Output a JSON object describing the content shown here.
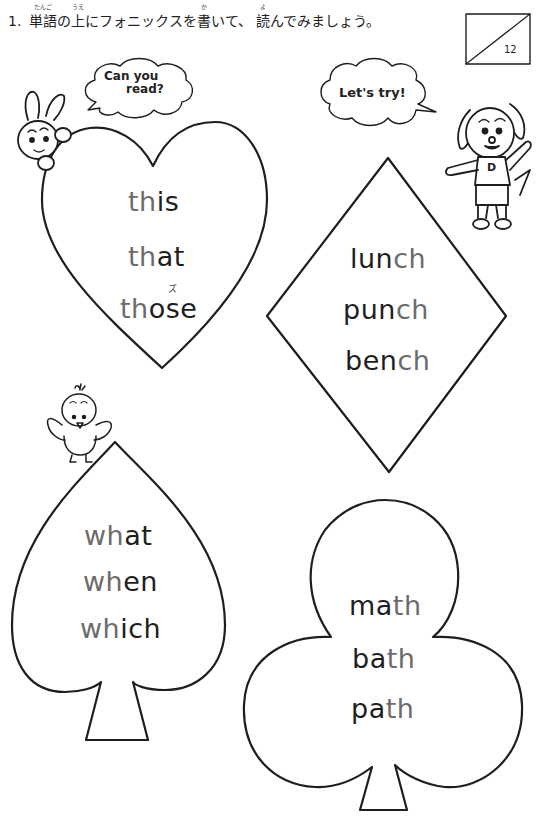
{
  "instruction": {
    "number": "1.",
    "segments": [
      {
        "text": "単語",
        "ruby": "たんご"
      },
      {
        "text": "の",
        "ruby": ""
      },
      {
        "text": "上",
        "ruby": "うえ"
      },
      {
        "text": "にフォニックスを",
        "ruby": ""
      },
      {
        "text": "書",
        "ruby": "か"
      },
      {
        "text": "いて、 ",
        "ruby": ""
      },
      {
        "text": "読",
        "ruby": "よ"
      },
      {
        "text": "んでみましょう。",
        "ruby": ""
      }
    ]
  },
  "score_box": {
    "total": "12"
  },
  "bubbles": {
    "rabbit": {
      "line1": "Can you",
      "line2": "read?"
    },
    "dog": {
      "text": "Let's try!"
    }
  },
  "characters": {
    "rabbit": "rabbit",
    "dog": "dog",
    "dog_shirt_letter": "D",
    "chick": "chick"
  },
  "cards": {
    "heart": {
      "shape": "heart",
      "phonics": "th",
      "words": [
        {
          "hl": "th",
          "rest": "is"
        },
        {
          "hl": "th",
          "rest": "at"
        },
        {
          "hl": "th",
          "rest": "ose"
        }
      ],
      "annotation": "ズ"
    },
    "diamond": {
      "shape": "diamond",
      "phonics": "ch",
      "words": [
        {
          "pre": "lun",
          "hl": "ch"
        },
        {
          "pre": "pun",
          "hl": "ch"
        },
        {
          "pre": "ben",
          "hl": "ch"
        }
      ]
    },
    "spade": {
      "shape": "spade",
      "phonics": "wh",
      "words": [
        {
          "hl": "wh",
          "rest": "at"
        },
        {
          "hl": "wh",
          "rest": "en"
        },
        {
          "hl": "wh",
          "rest": "ich"
        }
      ]
    },
    "club": {
      "shape": "club",
      "phonics": "th",
      "words": [
        {
          "pre": "ma",
          "hl": "th"
        },
        {
          "pre": "ba",
          "hl": "th"
        },
        {
          "pre": "pa",
          "hl": "th"
        }
      ]
    }
  },
  "colors": {
    "ink": "#1e1e1e",
    "highlight": "#6b6b6b",
    "background": "#ffffff"
  }
}
